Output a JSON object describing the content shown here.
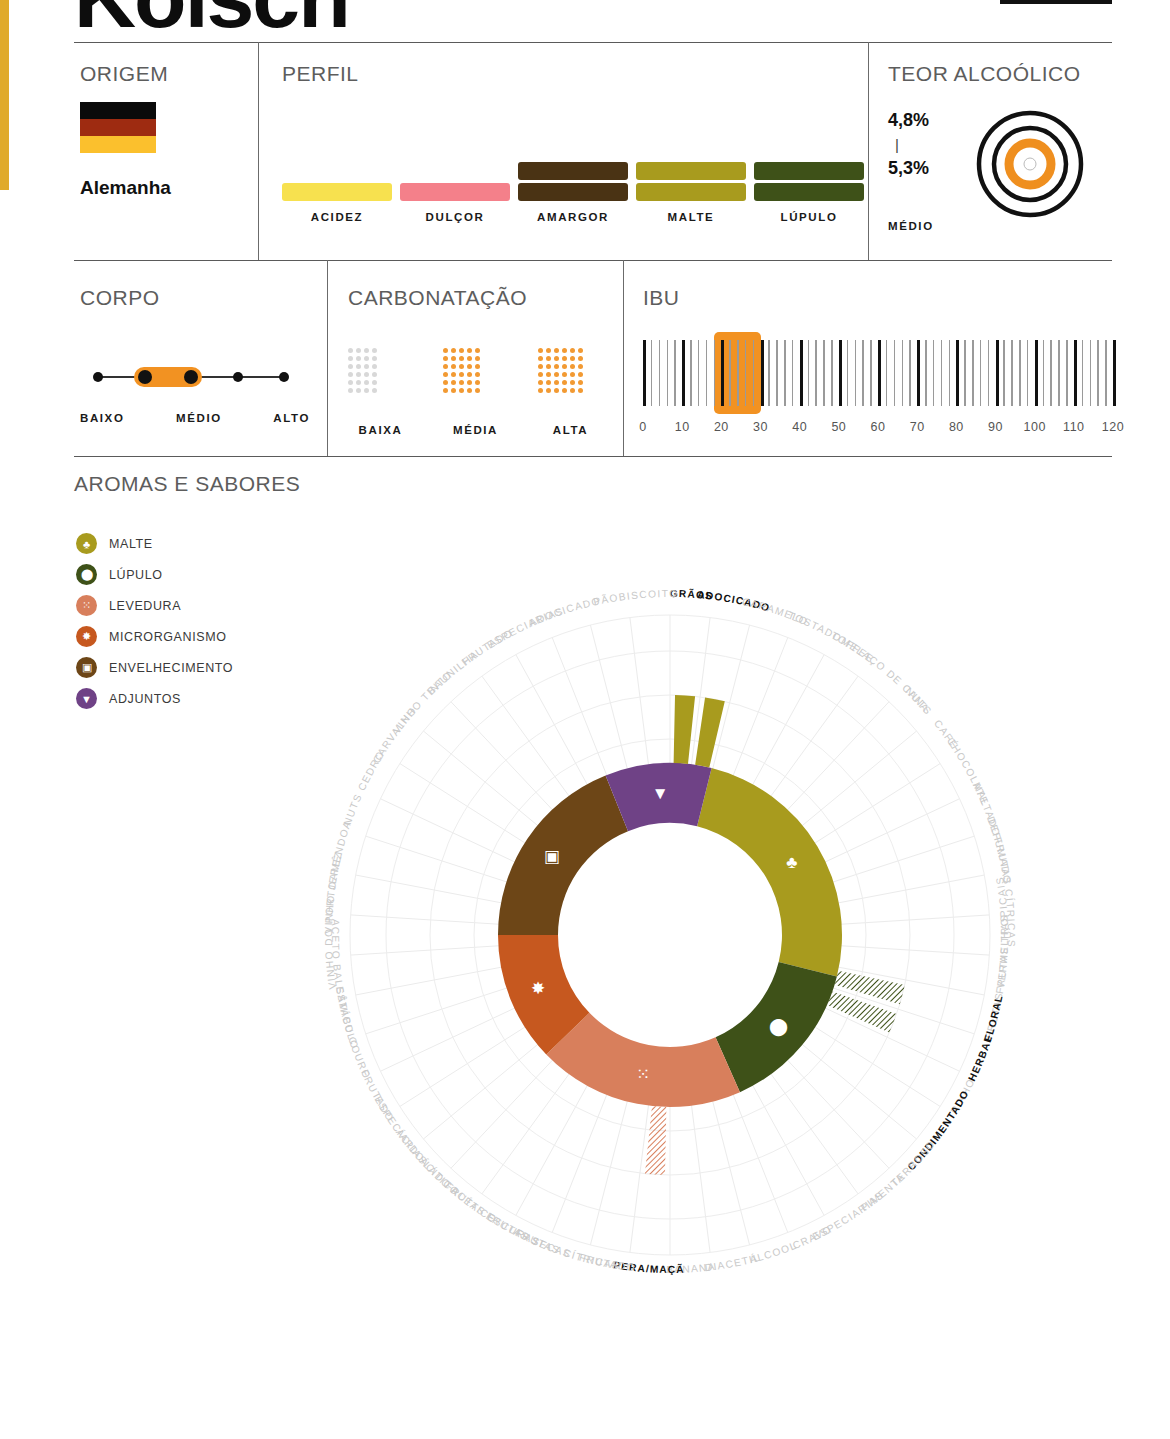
{
  "header": {
    "title": "Kölsch"
  },
  "origem": {
    "title": "ORIGEM",
    "country": "Alemanha",
    "flag_colors": [
      "#0a0a0a",
      "#9e2b11",
      "#fbc02d"
    ]
  },
  "perfil": {
    "title": "PERFIL",
    "items": [
      {
        "label": "ACIDEZ",
        "value": 1,
        "color": "#f7e14f"
      },
      {
        "label": "DULÇOR",
        "value": 1,
        "color": "#f4808a"
      },
      {
        "label": "AMARGOR",
        "value": 2,
        "color": "#4a3314"
      },
      {
        "label": "MALTE",
        "value": 2,
        "color": "#a89b1e"
      },
      {
        "label": "LÚPULO",
        "value": 2,
        "color": "#3e5118"
      }
    ],
    "max": 4
  },
  "teor_alcoolico": {
    "title": "TEOR ALCOÓLICO",
    "min": "4,8%",
    "separator": "|",
    "max": "5,3%",
    "category": "MÉDIO",
    "rings": 4,
    "active_ring": 2,
    "accent": "#ef8f1f"
  },
  "corpo": {
    "title": "CORPO",
    "points": 5,
    "active_from": 2,
    "active_to": 3,
    "labels": [
      "BAIXO",
      "MÉDIO",
      "ALTO"
    ],
    "accent": "#f29222"
  },
  "carbonatacao": {
    "title": "CARBONATAÇÃO",
    "levels": [
      {
        "label": "BAIXA",
        "cols": 4,
        "rows": 6,
        "active": false
      },
      {
        "label": "MÉDIA",
        "cols": 5,
        "rows": 6,
        "active": true
      },
      {
        "label": "ALTA",
        "cols": 6,
        "rows": 6,
        "active": true
      }
    ],
    "on_color": "#f29a33",
    "off_color": "#d8d8d8"
  },
  "ibu": {
    "title": "IBU",
    "scale_min": 0,
    "scale_max": 120,
    "ticks": [
      "0",
      "10",
      "20",
      "30",
      "40",
      "50",
      "60",
      "70",
      "80",
      "90",
      "100",
      "110",
      "120"
    ],
    "range_from": 18,
    "range_to": 30,
    "accent": "#f29222"
  },
  "aromas": {
    "title": "AROMAS E SABORES",
    "legend": [
      {
        "label": "MALTE",
        "color": "#a89b1e",
        "icon": "malt-icon"
      },
      {
        "label": "LÚPULO",
        "color": "#3e5118",
        "icon": "hop-icon"
      },
      {
        "label": "LEVEDURA",
        "color": "#d87f5c",
        "icon": "yeast-icon"
      },
      {
        "label": "MICRORGANISMO",
        "color": "#c6581f",
        "icon": "microorganism-icon"
      },
      {
        "label": "ENVELHECIMENTO",
        "color": "#6d4617",
        "icon": "barrel-icon"
      },
      {
        "label": "ADJUNTOS",
        "color": "#6f4286",
        "icon": "adjunct-icon"
      }
    ]
  },
  "chart_data": {
    "type": "pie",
    "title": "AROMAS E SABORES",
    "note": "Radial aroma wheel: inner donut = 6 aroma families, outer spokes = individual descriptors. Solid spoke = strong presence, hatched spoke = light presence, absent = not present.",
    "families": [
      {
        "name": "MALTE",
        "color": "#a89b1e",
        "start_deg": -76,
        "end_deg": 14,
        "icon": "malt-icon"
      },
      {
        "name": "LÚPULO",
        "color": "#3e5118",
        "start_deg": 14,
        "end_deg": 66,
        "icon": "hop-icon"
      },
      {
        "name": "LEVEDURA",
        "color": "#d87f5c",
        "start_deg": 66,
        "end_deg": 136,
        "icon": "yeast-icon"
      },
      {
        "name": "MICRORGANISMO",
        "color": "#c6581f",
        "start_deg": 136,
        "end_deg": 180,
        "icon": "microorganism-icon"
      },
      {
        "name": "ENVELHECIMENTO",
        "color": "#6d4617",
        "start_deg": 180,
        "end_deg": 248,
        "icon": "barrel-icon"
      },
      {
        "name": "ADJUNTOS",
        "color": "#6f4286",
        "start_deg": 248,
        "end_deg": 284,
        "icon": "adjunct-icon"
      }
    ],
    "descriptors": [
      {
        "label": "GRÃOS",
        "family": "MALTE",
        "intensity": "strong",
        "active": true
      },
      {
        "label": "ADOCICADO",
        "family": "MALTE",
        "intensity": "strong",
        "active": true
      },
      {
        "label": "CARAMELO",
        "family": "MALTE",
        "intensity": "none",
        "active": false
      },
      {
        "label": "TOSTADO",
        "family": "MALTE",
        "intensity": "none",
        "active": false
      },
      {
        "label": "TOFFEE",
        "family": "MALTE",
        "intensity": "none",
        "active": false
      },
      {
        "label": "MELAÇO DE CANA",
        "family": "MALTE",
        "intensity": "none",
        "active": false
      },
      {
        "label": "NUTS",
        "family": "MALTE",
        "intensity": "none",
        "active": false
      },
      {
        "label": "CAFÉ",
        "family": "MALTE",
        "intensity": "none",
        "active": false
      },
      {
        "label": "CHOCOLATE",
        "family": "MALTE",
        "intensity": "none",
        "active": false
      },
      {
        "label": "MALTADO",
        "family": "MALTE",
        "intensity": "none",
        "active": false
      },
      {
        "label": "DEFUMADO",
        "family": "LÚPULO",
        "intensity": "none",
        "active": false
      },
      {
        "label": "FRUTAS CÍTRICAS",
        "family": "LÚPULO",
        "intensity": "none",
        "active": false
      },
      {
        "label": "FRUTAS TROPICAIS",
        "family": "LÚPULO",
        "intensity": "none",
        "active": false
      },
      {
        "label": "FRUTAS VERMELHAS",
        "family": "LÚPULO",
        "intensity": "none",
        "active": false
      },
      {
        "label": "FLORAL",
        "family": "LÚPULO",
        "intensity": "light",
        "active": true
      },
      {
        "label": "HERBAL",
        "family": "LÚPULO",
        "intensity": "light",
        "active": true
      },
      {
        "label": "PINHO",
        "family": "LÚPULO",
        "intensity": "none",
        "active": false
      },
      {
        "label": "CONDIMENTADO",
        "family": "LEVEDURA",
        "intensity": "none",
        "active": true
      },
      {
        "label": "TERROSO",
        "family": "LEVEDURA",
        "intensity": "none",
        "active": false
      },
      {
        "label": "PIMENTA",
        "family": "LEVEDURA",
        "intensity": "none",
        "active": false
      },
      {
        "label": "ESPECIARIAS",
        "family": "LEVEDURA",
        "intensity": "none",
        "active": false
      },
      {
        "label": "CRAVO",
        "family": "LEVEDURA",
        "intensity": "none",
        "active": false
      },
      {
        "label": "ÁLCOOL",
        "family": "LEVEDURA",
        "intensity": "none",
        "active": false
      },
      {
        "label": "DIACETIL",
        "family": "LEVEDURA",
        "intensity": "none",
        "active": false
      },
      {
        "label": "BANANA",
        "family": "LEVEDURA",
        "intensity": "none",
        "active": false
      },
      {
        "label": "PERA/MAÇÃ",
        "family": "LEVEDURA",
        "intensity": "light",
        "active": true
      },
      {
        "label": "FRUTADO",
        "family": "MICRORGANISMO",
        "intensity": "none",
        "active": false
      },
      {
        "label": "FRUTAS CÍTRICAS",
        "family": "MICRORGANISMO",
        "intensity": "none",
        "active": false
      },
      {
        "label": "FRUTAS SECAS",
        "family": "MICRORGANISMO",
        "intensity": "none",
        "active": false
      },
      {
        "label": "FRUTAS ESCURAS",
        "family": "MICRORGANISMO",
        "intensity": "none",
        "active": false
      },
      {
        "label": "ÁCIDO ACÉTICO",
        "family": "MICRORGANISMO",
        "intensity": "none",
        "active": false
      },
      {
        "label": "ÁCIDO LÁTICO",
        "family": "MICRORGANISMO",
        "intensity": "none",
        "active": false
      },
      {
        "label": "ESPECIARIAS",
        "family": "MICRORGANISMO",
        "intensity": "none",
        "active": false
      },
      {
        "label": "FRUTADO",
        "family": "MICRORGANISMO",
        "intensity": "none",
        "active": false
      },
      {
        "label": "COURO",
        "family": "ENVELHECIMENTO",
        "intensity": "none",
        "active": false
      },
      {
        "label": "ESTÁBULO",
        "family": "ENVELHECIMENTO",
        "intensity": "none",
        "active": false
      },
      {
        "label": "ACETO BALSÂMICO",
        "family": "ENVELHECIMENTO",
        "intensity": "none",
        "active": false
      },
      {
        "label": "VINHO DO PORTO",
        "family": "ENVELHECIMENTO",
        "intensity": "none",
        "active": false
      },
      {
        "label": "VINHO JEREZ",
        "family": "ENVELHECIMENTO",
        "intensity": "none",
        "active": false
      },
      {
        "label": "AMÊNDOA",
        "family": "ENVELHECIMENTO",
        "intensity": "none",
        "active": false
      },
      {
        "label": "NUTS",
        "family": "ENVELHECIMENTO",
        "intensity": "none",
        "active": false
      },
      {
        "label": "CEDRO",
        "family": "ENVELHECIMENTO",
        "intensity": "none",
        "active": false
      },
      {
        "label": "CARVALHO",
        "family": "ENVELHECIMENTO",
        "intensity": "none",
        "active": false
      },
      {
        "label": "VINHO TINTO",
        "family": "ENVELHECIMENTO",
        "intensity": "none",
        "active": false
      },
      {
        "label": "BAUNILHA",
        "family": "ADJUNTOS",
        "intensity": "none",
        "active": false
      },
      {
        "label": "FRUTADO",
        "family": "ADJUNTOS",
        "intensity": "none",
        "active": false
      },
      {
        "label": "ESPECIARIAS",
        "family": "ADJUNTOS",
        "intensity": "none",
        "active": false
      },
      {
        "label": "ADOCICADO",
        "family": "ADJUNTOS",
        "intensity": "none",
        "active": false
      },
      {
        "label": "PÃO",
        "family": "MALTE",
        "intensity": "none",
        "active": false
      },
      {
        "label": "BISCOITO",
        "family": "MALTE",
        "intensity": "none",
        "active": false
      }
    ]
  }
}
